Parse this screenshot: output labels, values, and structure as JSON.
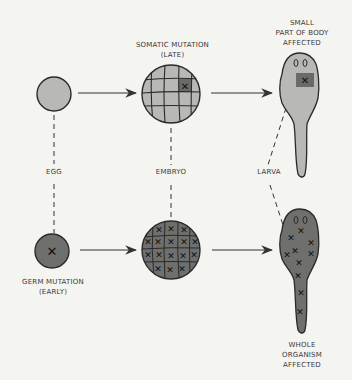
{
  "colors": {
    "background": "#f4f4f1",
    "light_fill": "#b8b8b6",
    "dark_fill": "#6f6f6d",
    "mutated_patch": "#6a6a68",
    "outline": "#2a2a2a",
    "line": "#333333"
  },
  "labels": {
    "somatic": "SOMATIC MUTATION\n(LATE)",
    "small_part": "SMALL\nPART OF BODY\nAFFECTED",
    "egg": "EGG",
    "embryo": "EMBRYO",
    "larva": "LARVA",
    "germ": "GERM  MUTATION\n(EARLY)",
    "whole": "WHOLE\nORGANISM\nAFFECTED"
  },
  "rows": [
    {
      "name": "somatic",
      "stages": [
        "egg",
        "embryo",
        "larva"
      ],
      "mutation_marks": 1
    },
    {
      "name": "germ",
      "stages": [
        "egg",
        "embryo",
        "larva"
      ],
      "mutation_marks": "all cells"
    }
  ]
}
